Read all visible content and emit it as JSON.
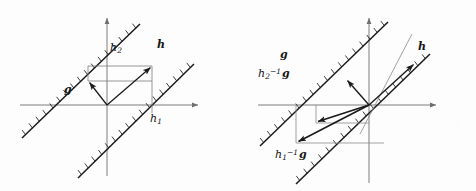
{
  "figure": {
    "background_color": "#fdfdfd",
    "stroke_color": "#1a1a1a",
    "axis_color": "#6e6e6e",
    "thin_line_color": "#8a8a8a",
    "width": 476,
    "height": 191
  },
  "panels": [
    {
      "id": "left",
      "name": "left-panel",
      "origin": {
        "x": 107,
        "y": 105
      },
      "axes": {
        "x_axis": {
          "x1": 20,
          "y1": 105,
          "x2": 200,
          "y2": 105,
          "arrow": "right"
        },
        "y_axis": {
          "x1": 107,
          "y1": 175,
          "x2": 107,
          "y2": 16,
          "arrow": "up"
        }
      },
      "hatched_lines": [
        {
          "name": "upper-half-plane-boundary",
          "x1": 22,
          "y1": 138,
          "x2": 138,
          "y2": 26,
          "hatch_side": "upper-left",
          "hatch_count": 17
        },
        {
          "name": "lower-half-plane-boundary",
          "x1": 78,
          "y1": 178,
          "x2": 192,
          "y2": 66,
          "hatch_side": "upper-left",
          "hatch_count": 17
        }
      ],
      "vectors": [
        {
          "name": "vector-h",
          "x1": 107,
          "y1": 105,
          "x2": 152,
          "y2": 66,
          "label": "h"
        },
        {
          "name": "vector-g",
          "x1": 107,
          "y1": 105,
          "x2": 88,
          "y2": 81,
          "label": "g"
        }
      ],
      "construction_lines": [
        {
          "name": "h1-vertical-guide",
          "x1": 152,
          "y1": 66,
          "x2": 152,
          "y2": 112
        },
        {
          "name": "h2-horizontal-guide-top",
          "x1": 88,
          "y1": 66,
          "x2": 152,
          "y2": 66
        },
        {
          "name": "h2-horizontal-guide-bottom",
          "x1": 88,
          "y1": 81,
          "x2": 152,
          "y2": 81
        },
        {
          "name": "h2-vertical-guide",
          "x1": 88,
          "y1": 66,
          "x2": 88,
          "y2": 81
        }
      ],
      "labels": [
        {
          "name": "label-h2",
          "text": "h",
          "sub": "2",
          "bold": false,
          "x": 110,
          "y": 47
        },
        {
          "name": "label-h-vector",
          "text": "h",
          "sub": "",
          "bold": true,
          "x": 157,
          "y": 44
        },
        {
          "name": "label-g-vector",
          "text": "g",
          "sub": "",
          "bold": true,
          "x": 65,
          "y": 87
        },
        {
          "name": "label-h1",
          "text": "h",
          "sub": "1",
          "bold": false,
          "x": 152,
          "y": 113
        }
      ]
    },
    {
      "id": "right",
      "name": "right-panel",
      "origin": {
        "x": 131,
        "y": 105
      },
      "axes": {
        "x_axis": {
          "x1": 20,
          "y1": 105,
          "x2": 200,
          "y2": 105,
          "arrow": "right"
        },
        "y_axis": {
          "x1": 131,
          "y1": 182,
          "x2": 131,
          "y2": 16,
          "arrow": "up"
        }
      },
      "hatched_lines": [
        {
          "name": "upper-half-plane-boundary",
          "x1": 22,
          "y1": 146,
          "x2": 148,
          "y2": 24,
          "hatch_side": "upper-left",
          "hatch_count": 18
        },
        {
          "name": "lower-half-plane-boundary",
          "x1": 58,
          "y1": 182,
          "x2": 190,
          "y2": 55,
          "hatch_side": "upper-left",
          "hatch_count": 18
        }
      ],
      "vectors": [
        {
          "name": "vector-h",
          "x1": 131,
          "y1": 105,
          "x2": 177,
          "y2": 63,
          "label": "h"
        },
        {
          "name": "vector-h2-inv-g",
          "x1": 131,
          "y1": 105,
          "x2": 108,
          "y2": 79,
          "label": "h2-inverse-g-up"
        },
        {
          "name": "vector-h2-inv-g-down",
          "x1": 131,
          "y1": 105,
          "x2": 78,
          "y2": 123,
          "label": "h2-inverse-g"
        },
        {
          "name": "vector-h1-inv-g",
          "x1": 131,
          "y1": 105,
          "x2": 58,
          "y2": 143,
          "label": "h1-inverse-g"
        }
      ],
      "construction_lines": [
        {
          "name": "thin-ray-diagonal",
          "x1": 124,
          "y1": 131,
          "x2": 172,
          "y2": 36
        },
        {
          "name": "h2-box-vertical",
          "x1": 78,
          "y1": 105,
          "x2": 78,
          "y2": 123
        },
        {
          "name": "h2-box-horizontal",
          "x1": 78,
          "y1": 123,
          "x2": 131,
          "y2": 123
        },
        {
          "name": "h1-box-vertical",
          "x1": 58,
          "y1": 105,
          "x2": 58,
          "y2": 143
        },
        {
          "name": "h1-box-horizontal",
          "x1": 58,
          "y1": 143,
          "x2": 144,
          "y2": 143
        }
      ],
      "labels": [
        {
          "name": "label-g-line",
          "text": "g",
          "sub": "",
          "bold": true,
          "x": 43,
          "y": 53
        },
        {
          "name": "label-h-vector",
          "text": "h",
          "sub": "",
          "bold": true,
          "x": 180,
          "y": 45
        },
        {
          "name": "label-h2-inv-g",
          "text": "h",
          "sub": "2",
          "sup": "-1",
          "suffix": "g",
          "bold": false,
          "x": 22,
          "y": 71
        },
        {
          "name": "label-h1-inv-g",
          "text": "h",
          "sub": "1",
          "sup": "-1",
          "suffix": "g",
          "bold": false,
          "x": 40,
          "y": 152
        }
      ]
    }
  ],
  "label_text": {
    "h": "h",
    "g": "g",
    "sub_1": "1",
    "sub_2": "2",
    "sup_inv": "−1"
  }
}
